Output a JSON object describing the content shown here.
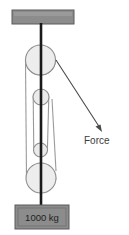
{
  "diagram": {
    "type": "pulley-system-mechanics-diagram",
    "background_color": "#ffffff",
    "ceiling_bracket": {
      "name": "ceiling-support-bracket",
      "fill": "#8c8c8c",
      "stroke": "#5a5a5a",
      "x": 12,
      "y": 10,
      "width": 62,
      "height": 14
    },
    "main_rope": {
      "name": "vertical-main-rope",
      "color": "#1a1a1a",
      "width": 2.6,
      "x": 41,
      "y_top": 23,
      "y_bottom": 205
    },
    "pulleys": [
      {
        "name": "top-fixed-pulley",
        "cx": 40.5,
        "cy": 60,
        "r": 15,
        "fill": "#ededed",
        "stroke": "#8f8f8f"
      },
      {
        "name": "upper-small-pulley",
        "cx": 41,
        "cy": 97,
        "r": 8,
        "fill": "#ebebeb",
        "stroke": "#8f8f8f"
      },
      {
        "name": "lower-small-pulley",
        "cx": 40.5,
        "cy": 150,
        "r": 7,
        "fill": "#ebebeb",
        "stroke": "#8f8f8f"
      },
      {
        "name": "bottom-movable-pulley",
        "cx": 41,
        "cy": 178,
        "r": 15,
        "fill": "#ededed",
        "stroke": "#8f8f8f"
      }
    ],
    "ropes": [
      {
        "name": "outer-left-rope",
        "x1": 25.5,
        "y1": 60,
        "x2": 26.5,
        "y2": 178,
        "color": "#9a9a9a"
      },
      {
        "name": "inner-rope-left",
        "x1": 33.5,
        "y1": 97,
        "x2": 34,
        "y2": 150,
        "color": "#9a9a9a"
      },
      {
        "name": "inner-rope-right",
        "x1": 49,
        "y1": 97,
        "x2": 47.5,
        "y2": 150,
        "color": "#9a9a9a"
      },
      {
        "name": "inner-rope-outer-right",
        "x1": 52,
        "y1": 100,
        "x2": 56,
        "y2": 172,
        "color": "#9a9a9a"
      }
    ],
    "force_arrow": {
      "name": "applied-force-arrow",
      "color": "#4a4a4a",
      "x1": 56,
      "y1": 60,
      "x2": 101,
      "y2": 130,
      "head_size": 5
    },
    "force_label": {
      "name": "force-label",
      "text": "Force",
      "x": 84,
      "y": 144,
      "color": "#3d3d3d"
    },
    "weight_block": {
      "name": "hanging-mass-block",
      "label": "1000 kg",
      "fill": "#8c8c8c",
      "stroke": "#5a5a5a",
      "text_color": "#1f1f1f",
      "x": 15,
      "y": 205,
      "width": 54,
      "height": 24
    }
  }
}
